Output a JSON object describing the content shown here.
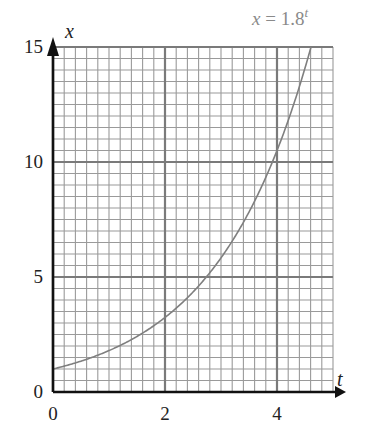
{
  "chart_data": {
    "type": "line",
    "title": "",
    "xlabel": "t",
    "ylabel": "x",
    "xlim": [
      0,
      5
    ],
    "ylim": [
      0,
      15
    ],
    "x_ticks": [
      0,
      2,
      4
    ],
    "y_ticks": [
      0,
      5,
      10,
      15
    ],
    "x_tick_labels": [
      "0",
      "2",
      "4"
    ],
    "y_tick_labels": [
      "0",
      "5",
      "10",
      "15"
    ],
    "grid": true,
    "grid_minor_x_step": 0.2,
    "grid_minor_y_step": 0.5,
    "grid_major_x_step": 2,
    "grid_major_y_step": 5,
    "legend": null,
    "annotations": [
      {
        "text": "x = 1.8^t",
        "position": "top-right",
        "color": "#8a8a8a"
      }
    ],
    "series": [
      {
        "name": "x = 1.8^t",
        "function": "1.8^t",
        "color": "#7f7f7f",
        "x": [
          0,
          0.5,
          1,
          1.5,
          2,
          2.5,
          3,
          3.5,
          4,
          4.5,
          4.6
        ],
        "y": [
          1.0,
          1.34,
          1.8,
          2.41,
          3.24,
          4.35,
          5.83,
          7.82,
          10.5,
          14.09,
          14.9
        ]
      }
    ]
  },
  "labels": {
    "x_axis_var": "t",
    "y_axis_var": "x",
    "annotation_lhs": "x",
    "annotation_eq": " = 1.8",
    "annotation_exp": "t",
    "origin_x_label": "0",
    "origin_y_label": "0"
  },
  "colors": {
    "grid_minor": "#9a9a9a",
    "grid_major": "#7a7a7a",
    "axis": "#111111",
    "curve": "#7f7f7f"
  }
}
